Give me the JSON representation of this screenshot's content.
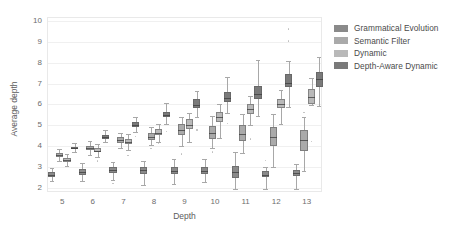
{
  "chart_data": {
    "type": "box",
    "title": "",
    "xlabel": "Depth",
    "ylabel": "Average depth",
    "xlim": [
      4.5,
      13.5
    ],
    "ylim": [
      1.75,
      10.15
    ],
    "grid": true,
    "grid_axis": "y",
    "legend_position": "right",
    "x_tick_labels": [
      "5",
      "6",
      "7",
      "8",
      "9",
      "10",
      "11",
      "12",
      "13"
    ],
    "y_tick_labels": [
      "2",
      "3",
      "4",
      "5",
      "6",
      "7",
      "8",
      "9",
      "10"
    ],
    "x_tick_values": [
      5,
      6,
      7,
      8,
      9,
      10,
      11,
      12,
      13
    ],
    "y_tick_values": [
      2,
      3,
      4,
      5,
      6,
      7,
      8,
      9,
      10
    ],
    "categories": [
      5,
      6,
      7,
      8,
      9,
      10,
      11,
      12,
      13
    ],
    "series": [
      {
        "name": "Grammatical Evolution",
        "color": "#8a8a8a",
        "boxes": [
          {
            "category": 5,
            "whisker_low": 2.33,
            "q1": 2.5,
            "median": 2.62,
            "q3": 2.78,
            "whisker_high": 2.96,
            "fliers": []
          },
          {
            "category": 6,
            "whisker_low": 2.32,
            "q1": 2.6,
            "median": 2.74,
            "q3": 2.9,
            "whisker_high": 3.18,
            "fliers": []
          },
          {
            "category": 7,
            "whisker_low": 2.38,
            "q1": 2.7,
            "median": 2.84,
            "q3": 2.98,
            "whisker_high": 3.25,
            "fliers": [
              2.22
            ]
          },
          {
            "category": 8,
            "whisker_low": 2.12,
            "q1": 2.68,
            "median": 2.86,
            "q3": 3.0,
            "whisker_high": 3.3,
            "fliers": []
          },
          {
            "category": 9,
            "whisker_low": 2.2,
            "q1": 2.66,
            "median": 2.82,
            "q3": 3.02,
            "whisker_high": 3.4,
            "fliers": []
          },
          {
            "category": 10,
            "whisker_low": 2.26,
            "q1": 2.66,
            "median": 2.8,
            "q3": 3.0,
            "whisker_high": 3.4,
            "fliers": []
          },
          {
            "category": 11,
            "whisker_low": 1.94,
            "q1": 2.46,
            "median": 2.78,
            "q3": 3.06,
            "whisker_high": 3.7,
            "fliers": []
          },
          {
            "category": 12,
            "whisker_low": 1.92,
            "q1": 2.5,
            "median": 2.62,
            "q3": 2.8,
            "whisker_high": 3.0,
            "fliers": [
              3.3
            ]
          },
          {
            "category": 13,
            "whisker_low": 1.96,
            "q1": 2.58,
            "median": 2.72,
            "q3": 2.86,
            "whisker_high": 3.12,
            "fliers": []
          }
        ]
      },
      {
        "name": "Semantic Filter",
        "color": "#aaaaaa",
        "boxes": [
          {
            "category": 5,
            "whisker_low": 3.3,
            "q1": 3.46,
            "median": 3.56,
            "q3": 3.66,
            "whisker_high": 3.84,
            "fliers": []
          },
          {
            "category": 6,
            "whisker_low": 3.56,
            "q1": 3.8,
            "median": 3.9,
            "q3": 4.02,
            "whisker_high": 4.24,
            "fliers": []
          },
          {
            "category": 7,
            "whisker_low": 3.92,
            "q1": 4.16,
            "median": 4.28,
            "q3": 4.42,
            "whisker_high": 4.62,
            "fliers": []
          },
          {
            "category": 8,
            "whisker_low": 4.04,
            "q1": 4.3,
            "median": 4.44,
            "q3": 4.62,
            "whisker_high": 4.9,
            "fliers": [
              3.9
            ]
          },
          {
            "category": 9,
            "whisker_low": 4.0,
            "q1": 4.54,
            "median": 4.76,
            "q3": 5.04,
            "whisker_high": 5.4,
            "fliers": [
              3.62
            ]
          },
          {
            "category": 10,
            "whisker_low": 3.9,
            "q1": 4.34,
            "median": 4.62,
            "q3": 4.96,
            "whisker_high": 5.46,
            "fliers": [
              3.72
            ]
          },
          {
            "category": 11,
            "whisker_low": 3.66,
            "q1": 4.26,
            "median": 4.6,
            "q3": 5.0,
            "whisker_high": 5.54,
            "fliers": []
          },
          {
            "category": 12,
            "whisker_low": 2.98,
            "q1": 4.02,
            "median": 4.44,
            "q3": 4.94,
            "whisker_high": 5.56,
            "fliers": []
          },
          {
            "category": 13,
            "whisker_low": 2.8,
            "q1": 3.78,
            "median": 4.3,
            "q3": 4.76,
            "whisker_high": 5.4,
            "fliers": [
              5.6
            ]
          }
        ]
      },
      {
        "name": "Dynamic",
        "color": "#b9b9b9",
        "boxes": [
          {
            "category": 5,
            "whisker_low": 3.04,
            "q1": 3.26,
            "median": 3.34,
            "q3": 3.44,
            "whisker_high": 3.64,
            "fliers": []
          },
          {
            "category": 6,
            "whisker_low": 3.46,
            "q1": 3.7,
            "median": 3.78,
            "q3": 3.92,
            "whisker_high": 4.1,
            "fliers": [
              3.28
            ]
          },
          {
            "category": 7,
            "whisker_low": 3.82,
            "q1": 4.08,
            "median": 4.18,
            "q3": 4.34,
            "whisker_high": 4.6,
            "fliers": [
              3.54
            ]
          },
          {
            "category": 8,
            "whisker_low": 4.2,
            "q1": 4.52,
            "median": 4.64,
            "q3": 4.8,
            "whisker_high": 5.04,
            "fliers": [
              4.12
            ]
          },
          {
            "category": 9,
            "whisker_low": 4.22,
            "q1": 4.84,
            "median": 5.02,
            "q3": 5.28,
            "whisker_high": 5.6,
            "fliers": []
          },
          {
            "category": 10,
            "whisker_low": 4.4,
            "q1": 5.14,
            "median": 5.4,
            "q3": 5.62,
            "whisker_high": 6.0,
            "fliers": []
          },
          {
            "category": 11,
            "whisker_low": 5.02,
            "q1": 5.52,
            "median": 5.78,
            "q3": 6.02,
            "whisker_high": 6.4,
            "fliers": [
              4.34
            ]
          },
          {
            "category": 12,
            "whisker_low": 5.06,
            "q1": 5.82,
            "median": 6.04,
            "q3": 6.28,
            "whisker_high": 6.7,
            "fliers": []
          },
          {
            "category": 13,
            "whisker_low": 5.96,
            "q1": 6.04,
            "median": 6.34,
            "q3": 6.76,
            "whisker_high": 7.26,
            "fliers": [
              4.22
            ]
          }
        ]
      },
      {
        "name": "Depth-Aware Dynamic",
        "color": "#7a7a7a",
        "boxes": [
          {
            "category": 5,
            "whisker_low": 3.72,
            "q1": 3.84,
            "median": 3.9,
            "q3": 3.96,
            "whisker_high": 4.14,
            "fliers": []
          },
          {
            "category": 6,
            "whisker_low": 4.18,
            "q1": 4.36,
            "median": 4.44,
            "q3": 4.54,
            "whisker_high": 4.76,
            "fliers": []
          },
          {
            "category": 7,
            "whisker_low": 4.66,
            "q1": 4.92,
            "median": 5.02,
            "q3": 5.16,
            "whisker_high": 5.42,
            "fliers": [
              4.46
            ]
          },
          {
            "category": 8,
            "whisker_low": 5.06,
            "q1": 5.38,
            "median": 5.5,
            "q3": 5.66,
            "whisker_high": 6.06,
            "fliers": [
              4.7
            ]
          },
          {
            "category": 9,
            "whisker_low": 5.38,
            "q1": 5.82,
            "median": 5.96,
            "q3": 6.24,
            "whisker_high": 6.66,
            "fliers": [
              4.78
            ]
          },
          {
            "category": 10,
            "whisker_low": 5.6,
            "q1": 6.14,
            "median": 6.32,
            "q3": 6.62,
            "whisker_high": 7.32,
            "fliers": [
              5.1
            ]
          },
          {
            "category": 11,
            "whisker_low": 5.44,
            "q1": 6.26,
            "median": 6.5,
            "q3": 6.9,
            "whisker_high": 8.14,
            "fliers": []
          },
          {
            "category": 12,
            "whisker_low": 5.9,
            "q1": 6.82,
            "median": 7.04,
            "q3": 7.46,
            "whisker_high": 8.1,
            "fliers": [
              9.04,
              9.62
            ]
          },
          {
            "category": 13,
            "whisker_low": 5.94,
            "q1": 6.86,
            "median": 7.22,
            "q3": 7.56,
            "whisker_high": 8.3,
            "fliers": []
          }
        ]
      }
    ]
  },
  "legend": {
    "items": [
      {
        "label": "Grammatical Evolution",
        "color": "#8a8a8a"
      },
      {
        "label": "Semantic Filter",
        "color": "#aaaaaa"
      },
      {
        "label": "Dynamic",
        "color": "#b9b9b9"
      },
      {
        "label": "Depth-Aware Dynamic",
        "color": "#7a7a7a"
      }
    ]
  }
}
